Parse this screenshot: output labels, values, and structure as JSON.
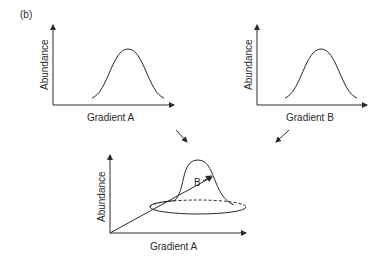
{
  "panel_label": "(b)",
  "plot_top_left": {
    "ylabel": "Abundance",
    "xlabel": "Gradient A"
  },
  "plot_top_right": {
    "ylabel": "Abundance",
    "xlabel": "Gradient B"
  },
  "plot_bottom": {
    "ylabel": "Abundance",
    "xlabel": "Gradient A",
    "depth_axis_label": "B"
  },
  "colors": {
    "line": "#2a2a2a",
    "background": "#ffffff"
  }
}
